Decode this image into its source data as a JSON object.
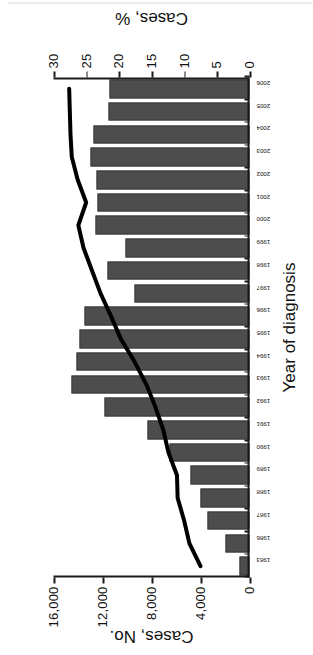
{
  "chart_data": {
    "type": "bar",
    "title": "",
    "xlabel": "Year of diagnosis",
    "ylabel": "Cases, No.",
    "ylabel_secondary": "Cases, %",
    "categories": [
      "1983",
      "1986",
      "1987",
      "1988",
      "1989",
      "1990",
      "1991",
      "1992",
      "1993",
      "1994",
      "1995",
      "1996",
      "1997",
      "1998",
      "1999",
      "2000",
      "2001",
      "2002",
      "2003",
      "2004",
      "2005",
      "2006"
    ],
    "ylim": [
      0,
      16000
    ],
    "yticks": [
      0,
      4000,
      8000,
      12000,
      16000
    ],
    "ytick_labels": [
      "0",
      "4,000",
      "8,000",
      "12,000",
      "16,000"
    ],
    "ylim_secondary": [
      0,
      30
    ],
    "yticks_secondary": [
      0,
      5,
      10,
      15,
      20,
      25,
      30
    ],
    "ytick_labels_secondary": [
      "0",
      "5",
      "10",
      "15",
      "20",
      "25",
      "30"
    ],
    "grid": false,
    "legend": "none",
    "series": [
      {
        "name": "Cases, No.",
        "kind": "bar",
        "axis": "left",
        "color": "#4d4d4d",
        "values": [
          800,
          2000,
          3400,
          4000,
          4800,
          6500,
          8300,
          11800,
          14500,
          14100,
          13900,
          13500,
          9400,
          11600,
          10100,
          12600,
          12400,
          12500,
          13000,
          12700,
          11500,
          11400
        ]
      },
      {
        "name": "Cases, %",
        "kind": "line",
        "axis": "right",
        "color": "#000000",
        "values": [
          7.5,
          9.2,
          10.0,
          11.0,
          11.1,
          12.4,
          13.2,
          14.4,
          15.8,
          17.6,
          19.7,
          21.2,
          22.8,
          24.1,
          25.4,
          26.2,
          25.0,
          26.3,
          27.2,
          27.4,
          27.5,
          27.6
        ]
      }
    ]
  },
  "axes": {
    "left_title": "Cases, No.",
    "right_title": "Cases, %",
    "x_title": "Year of diagnosis"
  }
}
